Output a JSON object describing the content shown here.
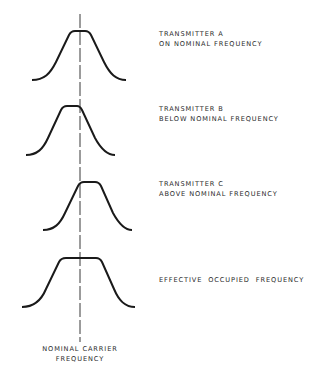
{
  "diagram": {
    "type": "frequency-spectrum-comparison",
    "center_line": {
      "label_line1": "NOMINAL CARRIER",
      "label_line2": "FREQUENCY",
      "x": 80,
      "y_start": 14,
      "y_end": 342,
      "style": "dashed"
    },
    "curves": [
      {
        "id": "transmitter-a",
        "title": "TRANSMITTER A",
        "subtitle": "ON NOMINAL FREQUENCY",
        "position": "centered"
      },
      {
        "id": "transmitter-b",
        "title": "TRANSMITTER B",
        "subtitle": "BELOW NOMINAL FREQUENCY",
        "position": "shifted-left"
      },
      {
        "id": "transmitter-c",
        "title": "TRANSMITTER C",
        "subtitle": "ABOVE NOMINAL FREQUENCY",
        "position": "shifted-right"
      },
      {
        "id": "effective",
        "title": "EFFECTIVE  OCCUPIED  FREQUENCY",
        "subtitle": "",
        "position": "widened"
      }
    ],
    "colors": {
      "line": "#1a1a1a",
      "background": "#ffffff"
    }
  }
}
